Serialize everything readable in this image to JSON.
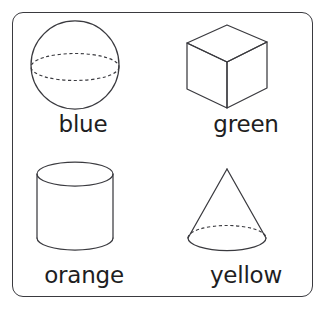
{
  "card": {
    "border_color": "#3a3a3f",
    "background_color": "#ffffff",
    "corner_radius": "11px"
  },
  "cells": [
    {
      "shape_name": "sphere",
      "icon": "sphere-icon",
      "label": "blue",
      "color_word": "blue",
      "hidden_edges": "dashed-equator-ellipse"
    },
    {
      "shape_name": "cube",
      "icon": "cube-icon",
      "label": "green",
      "color_word": "green",
      "hidden_edges": "none"
    },
    {
      "shape_name": "cylinder",
      "icon": "cylinder-icon",
      "label": "orange",
      "color_word": "orange",
      "hidden_edges": "none"
    },
    {
      "shape_name": "cone",
      "icon": "cone-icon",
      "label": "yellow",
      "color_word": "yellow",
      "hidden_edges": "dashed-base-back-arc"
    }
  ]
}
